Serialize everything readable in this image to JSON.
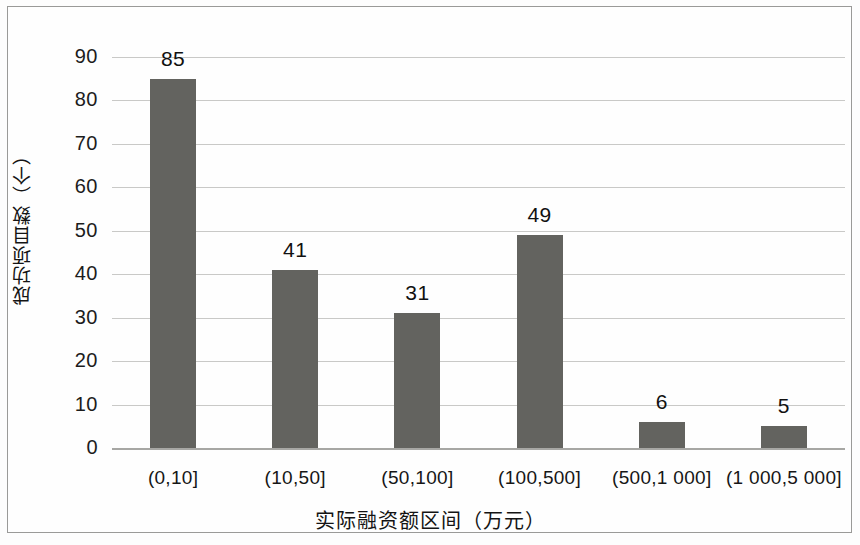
{
  "chart_data": {
    "type": "bar",
    "title": "",
    "categories": [
      "(0,10]",
      "(10,50]",
      "(50,100]",
      "(100,500]",
      "(500,1 000]",
      "(1 000,5 000]"
    ],
    "values": [
      85,
      41,
      31,
      49,
      6,
      5
    ],
    "data_labels": [
      "85",
      "41",
      "31",
      "49",
      "6",
      "5"
    ],
    "xlabel": "实际融资额区间（万元）",
    "ylabel": "成功项目数（个）",
    "ylim": [
      0,
      90
    ],
    "ytick_values": [
      0,
      10,
      20,
      30,
      40,
      50,
      60,
      70,
      80,
      90
    ],
    "ytick_labels": [
      "0",
      "10",
      "20",
      "30",
      "40",
      "50",
      "60",
      "70",
      "80",
      "90"
    ],
    "grid": "horizontal",
    "legend": "none",
    "bar_color": "#63635f",
    "gridline_color": "#c9c9c7",
    "axis_color": "#a7a7a4",
    "background_color": "#fefefe",
    "border_color": "#9a9a98"
  }
}
